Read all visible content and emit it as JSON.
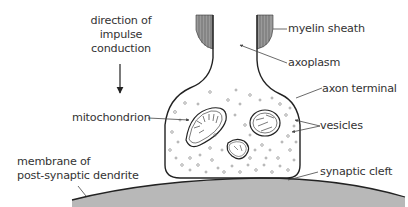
{
  "diagram": {
    "colors": {
      "line": "#222222",
      "text": "#333333",
      "membrane_fill": "#b8b8b8",
      "myelin_fill": "#9a9a9a"
    },
    "labels": {
      "direction": [
        "direction of",
        "impulse",
        "conduction"
      ],
      "myelin_sheath": "myelin sheath",
      "axoplasm": "axoplasm",
      "axon_terminal": "axon terminal",
      "mitochondrion": "mitochondrion",
      "vesicles": "vesicles",
      "membrane": [
        "membrane of",
        "post-synaptic dendrite"
      ],
      "synaptic_cleft": "synaptic cleft"
    }
  }
}
